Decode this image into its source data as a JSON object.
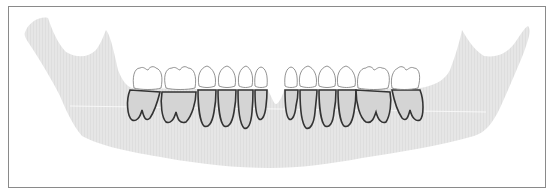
{
  "figure": {
    "colors": {
      "frame_border": "#8a8a8a",
      "background": "#ffffff",
      "bone": "#e4e4e4",
      "root": "#d2d2d2",
      "root_outline": "#3a3a3a",
      "crown": "#ffffff",
      "crown_outline": "#6a6a6a",
      "reference_line": "#ffffff"
    },
    "teeth": {
      "left": [
        {
          "type": "molar",
          "x0": 133,
          "x1": 162
        },
        {
          "type": "molar",
          "x0": 164,
          "x1": 197
        },
        {
          "type": "premolar",
          "x0": 198,
          "x1": 216
        },
        {
          "type": "premolar",
          "x0": 217,
          "x1": 237
        },
        {
          "type": "canine",
          "x0": 238,
          "x1": 253
        },
        {
          "type": "incisor",
          "x0": 254,
          "x1": 268
        }
      ],
      "right": [
        {
          "type": "incisor",
          "x0": 285,
          "x1": 300
        },
        {
          "type": "canine",
          "x0": 300,
          "x1": 318
        },
        {
          "type": "premolar",
          "x0": 318,
          "x1": 337
        },
        {
          "type": "premolar",
          "x0": 337,
          "x1": 357
        },
        {
          "type": "molar",
          "x0": 357,
          "x1": 390
        },
        {
          "type": "molar",
          "x0": 390,
          "x1": 420
        }
      ]
    }
  }
}
